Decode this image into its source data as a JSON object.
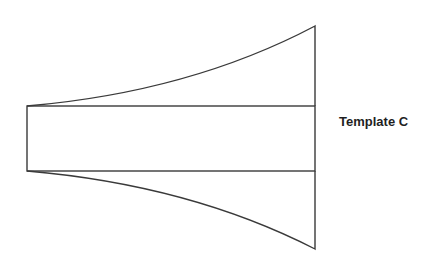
{
  "diagram": {
    "title": "Template C",
    "stroke_color": "#3a3a3a",
    "background": "#ffffff",
    "shape": {
      "description": "Flared template: central rectangle with curved flaring wings widening to the right",
      "left_x": 27,
      "right_x": 315,
      "rect_top_y": 106,
      "rect_bottom_y": 171,
      "top_apex_y": 26,
      "bottom_apex_y": 249
    }
  }
}
